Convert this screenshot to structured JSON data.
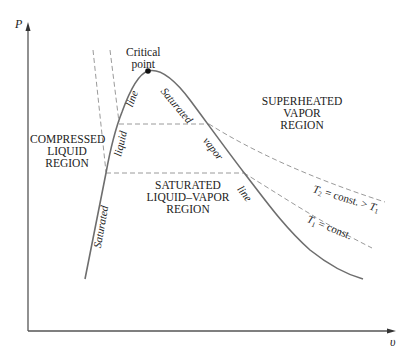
{
  "diagram": {
    "type": "P-v diagram (phase diagram of a pure substance)",
    "axes": {
      "y_label": "P",
      "x_label": "υ"
    },
    "critical_point": {
      "label_line1": "Critical",
      "label_line2": "point"
    },
    "regions": {
      "compressed_liquid": {
        "line1": "COMPRESSED",
        "line2": "LIQUID",
        "line3": "REGION"
      },
      "saturated_mixture": {
        "line1": "SATURATED",
        "line2": "LIQUID–VAPOR",
        "line3": "REGION"
      },
      "superheated_vapor": {
        "line1": "SUPERHEATED",
        "line2": "VAPOR",
        "line3": "REGION"
      }
    },
    "saturation_labels": {
      "liquid_side": [
        "Saturated",
        "liquid",
        "line"
      ],
      "vapor_side": [
        "Saturated",
        "vapor",
        "line"
      ]
    },
    "isotherms": {
      "t2": {
        "sym": "T",
        "sub": "2",
        "text": " = const. > ",
        "cmp_sym": "T",
        "cmp_sub": "1"
      },
      "t1": {
        "sym": "T",
        "sub": "1",
        "text": " = const."
      }
    },
    "colors": {
      "curve": "#6e6e6e",
      "dashed": "#9a9a9a",
      "axis": "#555555",
      "text": "#222222"
    }
  }
}
